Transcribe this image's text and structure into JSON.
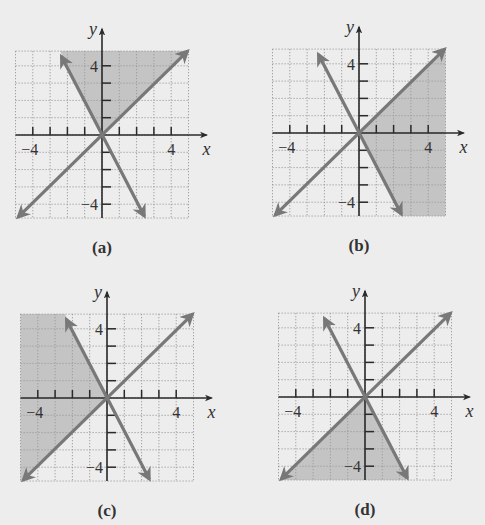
{
  "colors": {
    "background": "#ededed",
    "grid": "#9a9a9a",
    "shade": "#c4c4c4",
    "line": "#787878",
    "axis": "#2a2a2a"
  },
  "chart_data": [
    {
      "type": "line",
      "panel": "(a)",
      "title": "(a)",
      "xlabel": "x",
      "ylabel": "y",
      "xlim": [
        -5,
        5
      ],
      "ylim": [
        -4.8,
        5
      ],
      "x_tick_labels": [
        "-4",
        "4"
      ],
      "y_tick_labels": [
        "4",
        "-4"
      ],
      "grid": true,
      "series": [
        {
          "name": "y = x",
          "x": [
            -5,
            5
          ],
          "y": [
            -5,
            5
          ]
        },
        {
          "name": "y = -2x",
          "x": [
            -2.4,
            2.4
          ],
          "y": [
            4.8,
            -4.8
          ]
        }
      ],
      "shaded_region": "above both lines (y >= x and y >= -2x)"
    },
    {
      "type": "line",
      "panel": "(b)",
      "title": "(b)",
      "xlabel": "x",
      "ylabel": "y",
      "xlim": [
        -5,
        5
      ],
      "ylim": [
        -4.8,
        5
      ],
      "x_tick_labels": [
        "-4",
        "4"
      ],
      "y_tick_labels": [
        "4",
        "-4"
      ],
      "grid": true,
      "series": [
        {
          "name": "y = x",
          "x": [
            -5,
            5
          ],
          "y": [
            -5,
            5
          ]
        },
        {
          "name": "y = -2x",
          "x": [
            -2.4,
            2.4
          ],
          "y": [
            4.8,
            -4.8
          ]
        }
      ],
      "shaded_region": "right of both lines (y <= x and y >= -2x)"
    },
    {
      "type": "line",
      "panel": "(c)",
      "title": "(c)",
      "xlabel": "x",
      "ylabel": "y",
      "xlim": [
        -5,
        5
      ],
      "ylim": [
        -4.8,
        5
      ],
      "x_tick_labels": [
        "-4",
        "4"
      ],
      "y_tick_labels": [
        "4",
        "-4"
      ],
      "grid": true,
      "series": [
        {
          "name": "y = x",
          "x": [
            -5,
            5
          ],
          "y": [
            -5,
            5
          ]
        },
        {
          "name": "y = -2x",
          "x": [
            -2.4,
            2.4
          ],
          "y": [
            4.8,
            -4.8
          ]
        }
      ],
      "shaded_region": "left of both lines (y >= x and y <= -2x)"
    },
    {
      "type": "line",
      "panel": "(d)",
      "title": "(d)",
      "xlabel": "x",
      "ylabel": "y",
      "xlim": [
        -5,
        5
      ],
      "ylim": [
        -4.8,
        5
      ],
      "x_tick_labels": [
        "-4",
        "4"
      ],
      "y_tick_labels": [
        "4",
        "-4"
      ],
      "grid": true,
      "series": [
        {
          "name": "y = x",
          "x": [
            -5,
            5
          ],
          "y": [
            -5,
            5
          ]
        },
        {
          "name": "y = -2x",
          "x": [
            -2.4,
            2.4
          ],
          "y": [
            4.8,
            -4.8
          ]
        }
      ],
      "shaded_region": "below both lines (y <= x and y <= -2x)"
    }
  ],
  "panels": [
    {
      "id": "a",
      "label": "(a)",
      "origin": [
        102,
        135
      ],
      "shade": "top",
      "x_axis_label": "x",
      "y_axis_label": "y",
      "xtick_neg": "−4",
      "xtick_pos": "4",
      "ytick_pos": "4",
      "ytick_neg": "−4"
    },
    {
      "id": "b",
      "label": "(b)",
      "origin": [
        359,
        133
      ],
      "shade": "right",
      "x_axis_label": "x",
      "y_axis_label": "y",
      "xtick_neg": "−4",
      "xtick_pos": "4",
      "ytick_pos": "4",
      "ytick_neg": "−4"
    },
    {
      "id": "c",
      "label": "(c)",
      "origin": [
        107,
        398
      ],
      "shade": "left",
      "x_axis_label": "x",
      "y_axis_label": "y",
      "xtick_neg": "−4",
      "xtick_pos": "4",
      "ytick_pos": "4",
      "ytick_neg": "−4"
    },
    {
      "id": "d",
      "label": "(d)",
      "origin": [
        365,
        397
      ],
      "shade": "bottom",
      "x_axis_label": "x",
      "y_axis_label": "y",
      "xtick_neg": "−4",
      "xtick_pos": "4",
      "ytick_pos": "4",
      "ytick_neg": "−4"
    }
  ]
}
